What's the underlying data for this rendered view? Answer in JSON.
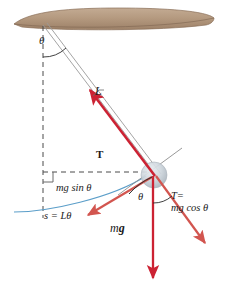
{
  "figure": {
    "background_color": "#ffffff"
  },
  "colors": {
    "force_arrow": "#cc2233",
    "tension_arrow": "#c0392b",
    "string": "#9a9a9a",
    "beam_fill": "#b79c83",
    "beam_edge": "#8a6f57",
    "bob_fill": "#bcc4cc",
    "arc_path": "#5b9ec9",
    "dashed_guide": "#555555",
    "text": "#1a1a1a"
  },
  "labels": {
    "theta_top": "θ",
    "length": "L",
    "tension": "T",
    "mg_sin_theta": "mg sin θ",
    "arc_length": "s = Lθ",
    "theta_bob": "θ",
    "tension_eq_line1": "T=",
    "tension_eq_line2": "mg cos θ",
    "weight_m": "m",
    "weight_g": "g"
  },
  "elements": {
    "ceiling_beam": "wooden-support-beam",
    "pivot": "pendulum-pivot-point",
    "string": "pendulum-string",
    "bob": "pendulum-bob",
    "vertical_dashed": "vertical-reference-line",
    "horizontal_dashed": "horizontal-reference-line",
    "right_angle_marker": "right-angle-marker",
    "swing_arc": "pendulum-swing-arc",
    "tangent_line": "tangent-line-at-bob",
    "arrow_tension": "tension-force-arrow",
    "arrow_weight": "weight-force-arrow",
    "arrow_mg_sin": "tangential-component-arrow",
    "arrow_mg_cos": "radial-component-arrow",
    "angle_arc_top": "angle-arc-at-pivot",
    "angle_arc_bob": "angle-arc-at-bob"
  }
}
